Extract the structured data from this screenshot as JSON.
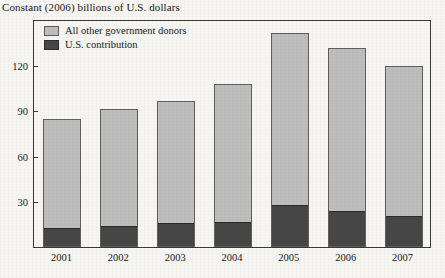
{
  "chart_data": {
    "type": "bar",
    "subtype": "stacked-vertical",
    "title": "Constant (2006) billions of U.S. dollars",
    "xlabel": "",
    "ylabel": "",
    "ylim": [
      0,
      150
    ],
    "yticks": [
      30,
      60,
      90,
      120
    ],
    "ytick_labels": [
      "30",
      "60",
      "90",
      "120"
    ],
    "grid": false,
    "legend_position": "top-left-inside",
    "categories": [
      "2001",
      "2002",
      "2003",
      "2004",
      "2005",
      "2006",
      "2007"
    ],
    "series": [
      {
        "name": "U.S. contribution",
        "color": "#464646",
        "values": [
          12,
          13,
          15,
          16,
          27,
          23,
          20
        ]
      },
      {
        "name": "All other government donors",
        "color": "#bdbdbd",
        "values": [
          72,
          78,
          81,
          91,
          114,
          108,
          99
        ]
      }
    ],
    "totals": [
      84,
      91,
      96,
      107,
      141,
      131,
      119
    ],
    "stack_order": [
      "U.S. contribution",
      "All other government donors"
    ]
  },
  "legend": {
    "items": [
      {
        "label": "All other government donors",
        "swatch": "other"
      },
      {
        "label": "U.S. contribution",
        "swatch": "us"
      }
    ]
  },
  "colors": {
    "background": "#f6f5f1",
    "frame": "#3a3a3a",
    "bar_light": "#bdbdbd",
    "bar_dark": "#464646",
    "text": "#1a1a1a"
  }
}
